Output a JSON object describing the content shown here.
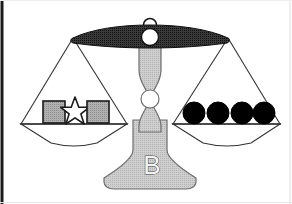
{
  "figure": {
    "base_label": "B",
    "background_color": "#ffffff",
    "border": {
      "left_color": "#1a1a1a",
      "right_color": "#d8d8d8",
      "bottom_color": "#e8e8e8",
      "left_width": 3,
      "right_width": 1,
      "bottom_width": 1
    },
    "canvas": {
      "width": 292,
      "height": 204
    }
  },
  "beam": {
    "name": "balance-beam",
    "fill_color": "#3d3d3d",
    "stroke_color": "#1a1a1a",
    "left_tip_x": 73,
    "right_tip_x": 228,
    "center_x": 150,
    "top_y": 30,
    "pivot_circle": {
      "cx": 150,
      "cy": 37,
      "r": 8,
      "fill": "#ffffff",
      "stroke": "#1a1a1a"
    },
    "hanger_ring": {
      "cx": 150,
      "cy": 26,
      "r": 6,
      "fill": "#ffffff",
      "stroke": "#1a1a1a"
    }
  },
  "column": {
    "name": "center-column",
    "fill_color": "#c9c9c9",
    "stroke_color": "#6e6e6e",
    "joint_circle": {
      "cx": 150,
      "cy": 99,
      "r": 9,
      "fill": "#ffffff",
      "stroke": "#6e6e6e"
    }
  },
  "base": {
    "name": "scale-base",
    "fill_color": "#c9c9c9",
    "stroke_color": "#6e6e6e",
    "label": "B",
    "label_x": 152,
    "label_y": 174,
    "label_fill": "#f2f2f2",
    "label_stroke": "#4a4a4a"
  },
  "pans": [
    {
      "name": "left-pan",
      "side": "left",
      "anchor_x": 73,
      "anchor_y": 38,
      "bar_y": 124,
      "bar_left_x": 20,
      "bar_right_x": 128,
      "dish_bottom_y": 145,
      "stroke_color": "#333333",
      "fill_color": "#ffffff",
      "items": [
        {
          "name": "gray-square-left",
          "shape": "square",
          "x": 43,
          "y": 101,
          "size": 22,
          "fill": "#aaaaaa",
          "stroke": "#1a1a1a"
        },
        {
          "name": "white-star",
          "shape": "star",
          "cx": 75,
          "cy": 112,
          "outer_r": 15,
          "inner_r": 6.4,
          "points": 5,
          "fill": "#ffffff",
          "stroke": "#1a1a1a"
        },
        {
          "name": "gray-square-right",
          "shape": "square",
          "x": 87,
          "y": 101,
          "size": 22,
          "fill": "#aaaaaa",
          "stroke": "#1a1a1a"
        }
      ],
      "item_count": 3,
      "item_summary": "2 gray squares, 1 white star"
    },
    {
      "name": "right-pan",
      "side": "right",
      "anchor_x": 228,
      "anchor_y": 38,
      "bar_y": 124,
      "bar_left_x": 172,
      "bar_right_x": 281,
      "dish_bottom_y": 145,
      "stroke_color": "#333333",
      "fill_color": "#ffffff",
      "items": [
        {
          "name": "black-circle-1",
          "shape": "circle",
          "cx": 194,
          "cy": 113,
          "r": 11,
          "fill": "#000000",
          "stroke": "#000000"
        },
        {
          "name": "black-circle-2",
          "shape": "circle",
          "cx": 218,
          "cy": 113,
          "r": 11,
          "fill": "#000000",
          "stroke": "#000000"
        },
        {
          "name": "black-circle-3",
          "shape": "circle",
          "cx": 242,
          "cy": 113,
          "r": 11,
          "fill": "#000000",
          "stroke": "#000000"
        },
        {
          "name": "black-circle-4",
          "shape": "circle",
          "cx": 264,
          "cy": 113,
          "r": 11,
          "fill": "#000000",
          "stroke": "#000000"
        }
      ],
      "item_count": 4,
      "item_summary": "4 black circles"
    }
  ]
}
